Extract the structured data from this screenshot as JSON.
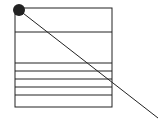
{
  "diagram": {
    "stroke_color": "#222222",
    "dot_color": "#222222",
    "background": "#ffffff",
    "horizontal_divider_count": 6
  }
}
